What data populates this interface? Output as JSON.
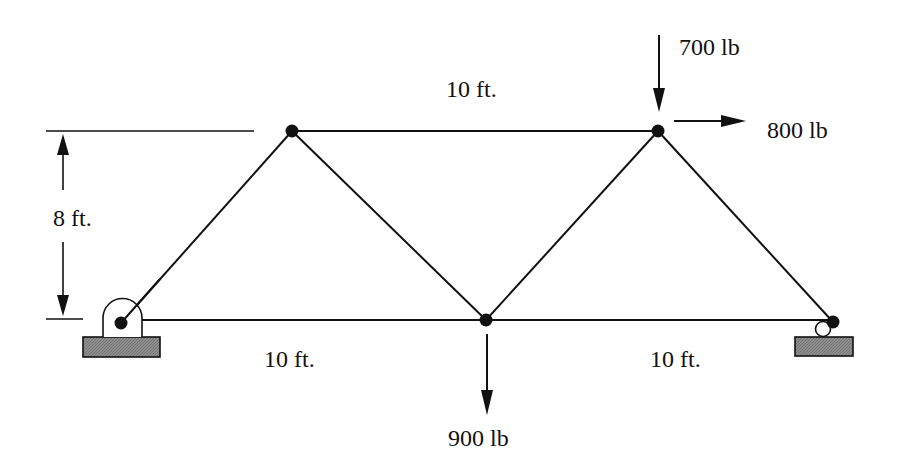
{
  "diagram": {
    "type": "truss",
    "dimensions": {
      "top_chord": "10 ft.",
      "height": "8 ft.",
      "bottom_left": "10 ft.",
      "bottom_right": "10 ft."
    },
    "loads": {
      "top_right_vertical": "700 lb",
      "top_right_horizontal": "800 lb",
      "bottom_middle_vertical": "900 lb"
    },
    "supports": {
      "left": "pin",
      "right": "roller"
    },
    "colors": {
      "line": "#111111",
      "pedestal": "#8a8a8a"
    }
  }
}
